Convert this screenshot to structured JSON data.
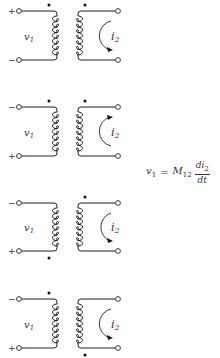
{
  "figure": {
    "diagrams": [
      {
        "id": "a",
        "top_y": 11,
        "bottom_y": 60,
        "top_sign": "+",
        "bottom_sign": "−",
        "primary_dot": "top",
        "secondary_dot": "top",
        "current_arrow": "clockwise",
        "voltage_label": "v",
        "voltage_sub": "1",
        "current_label": "i",
        "current_sub": "2"
      },
      {
        "id": "b",
        "top_y": 107,
        "bottom_y": 156,
        "top_sign": "−",
        "bottom_sign": "+",
        "primary_dot": "top",
        "secondary_dot": "top",
        "current_arrow": "counterclockwise",
        "voltage_label": "v",
        "voltage_sub": "1",
        "current_label": "i",
        "current_sub": "2"
      },
      {
        "id": "c",
        "top_y": 203,
        "bottom_y": 251,
        "top_sign": "−",
        "bottom_sign": "+",
        "primary_dot": "bottom",
        "secondary_dot": "top",
        "current_arrow": "clockwise",
        "voltage_label": "v",
        "voltage_sub": "1",
        "current_label": "i",
        "current_sub": "2"
      },
      {
        "id": "d",
        "top_y": 299,
        "bottom_y": 348,
        "top_sign": "−",
        "bottom_sign": "+",
        "primary_dot": "top",
        "secondary_dot": "bottom",
        "current_arrow": "clockwise",
        "voltage_label": "v",
        "voltage_sub": "1",
        "current_label": "i",
        "current_sub": "2"
      }
    ],
    "equation": {
      "lhs": "v",
      "lhs_sub": "1",
      "equals": "=",
      "coef": "M",
      "coef_sub": "12",
      "numerator": "di",
      "numerator_sub": "2",
      "denominator": "dt"
    },
    "colors": {
      "ink": "#222222",
      "background": "#ffffff"
    }
  }
}
